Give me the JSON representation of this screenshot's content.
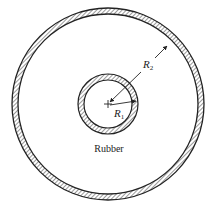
{
  "diagram": {
    "type": "concentric-cylinders-cross-section",
    "colors": {
      "line": "#222222",
      "hatch": "#555555",
      "background": "#ffffff"
    },
    "outer_ring": {
      "cx": 108,
      "cy": 104,
      "r_outer": 96,
      "thickness": 6
    },
    "inner_ring": {
      "cx": 108,
      "cy": 104,
      "r_outer": 30,
      "thickness": 6
    },
    "labels": {
      "r2_symbol": "R",
      "r2_subscript": "2",
      "r1_symbol": "R",
      "r1_subscript": "1",
      "material": "Rubber"
    }
  }
}
